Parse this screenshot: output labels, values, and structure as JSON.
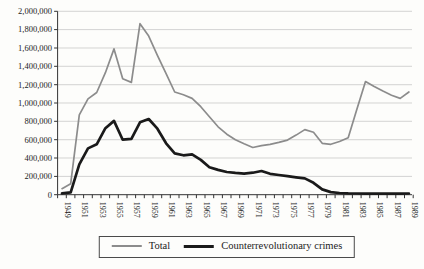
{
  "figure": {
    "background_color": "#fdfdfb",
    "axis_color": "#333333",
    "gridline_color": "#c2c2c2",
    "text_color": "#1c1c1c"
  },
  "chart_data": {
    "type": "line",
    "title": "",
    "xlabel": "",
    "ylabel": "",
    "grid": "horizontal",
    "legend_position": "bottom",
    "ylim": [
      0,
      2000000
    ],
    "y_tick_step": 200000,
    "y_tick_labels": [
      "0",
      "200,000",
      "400,000",
      "600,000",
      "800,000",
      "1,000,000",
      "1,200,000",
      "1,400,000",
      "1,600,000",
      "1,800,000",
      "2,000,000"
    ],
    "x_label_every": 2,
    "years": [
      1949,
      1950,
      1951,
      1952,
      1953,
      1954,
      1955,
      1956,
      1957,
      1958,
      1959,
      1960,
      1961,
      1962,
      1963,
      1964,
      1965,
      1966,
      1967,
      1968,
      1969,
      1970,
      1971,
      1972,
      1973,
      1974,
      1975,
      1976,
      1977,
      1978,
      1979,
      1980,
      1981,
      1982,
      1983,
      1984,
      1985,
      1986,
      1987,
      1988,
      1989
    ],
    "series": [
      {
        "name": "Total",
        "color": "#8c8c8c",
        "values": [
          65000,
          120000,
          870000,
          1045000,
          1115000,
          1330000,
          1590000,
          1265000,
          1225000,
          1865000,
          1730000,
          1520000,
          1320000,
          1120000,
          1090000,
          1050000,
          960000,
          850000,
          740000,
          660000,
          600000,
          555000,
          515000,
          535000,
          550000,
          570000,
          595000,
          650000,
          710000,
          680000,
          560000,
          550000,
          580000,
          620000,
          930000,
          1235000,
          1180000,
          1130000,
          1085000,
          1050000,
          1120000
        ]
      },
      {
        "name": "Counterrevolutionary crimes",
        "color": "#1a1a1a",
        "values": [
          15000,
          25000,
          330000,
          505000,
          550000,
          725000,
          805000,
          600000,
          610000,
          790000,
          825000,
          720000,
          560000,
          450000,
          430000,
          440000,
          380000,
          300000,
          270000,
          248000,
          238000,
          230000,
          240000,
          258000,
          228000,
          215000,
          203000,
          190000,
          178000,
          130000,
          58000,
          28000,
          18000,
          14000,
          13000,
          12000,
          12000,
          12000,
          12000,
          12000,
          13000
        ]
      }
    ]
  }
}
